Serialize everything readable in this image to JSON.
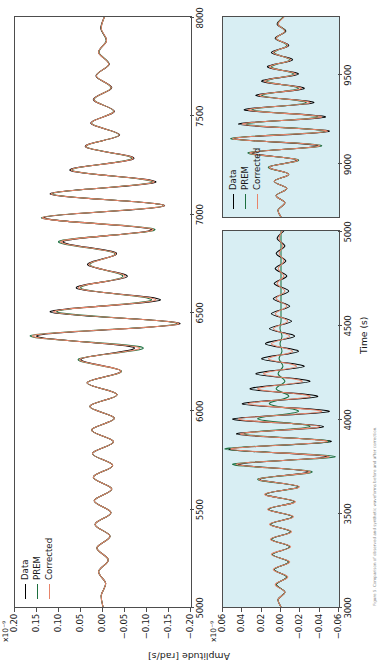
{
  "figure": {
    "shared_ylabel": "Amplitude [rad/s]",
    "shared_xlabel": "Time (s)",
    "background_plain": "#ffffff",
    "background_tinted": "#d8eef3",
    "caption": "Figure 5. Comparison of observed and synthetic waveforms before and after correction."
  },
  "legend": {
    "entries": [
      {
        "label": "Data",
        "color": "#000000"
      },
      {
        "label": "PREM",
        "color": "#1d6f3f"
      },
      {
        "label": "Corrected",
        "color": "#e8846a"
      }
    ]
  },
  "chart_data": [
    {
      "id": "panel-top",
      "type": "line",
      "title": "",
      "xlabel": "",
      "ylabel": "Amplitude [rad/s]",
      "y_exponent": "x10⁻⁹",
      "xlim": [
        5000,
        8000
      ],
      "ylim": [
        -0.2,
        0.2
      ],
      "xticks": [
        5000,
        5500,
        6000,
        6500,
        7000,
        7500,
        8000
      ],
      "xticklabels": [
        "5000",
        "5500",
        "6000",
        "6500",
        "7000",
        "7500",
        "8000"
      ],
      "yticks": [
        0.2,
        0.15,
        0.1,
        0.05,
        0.0,
        -0.05,
        -0.1,
        -0.15,
        -0.2
      ],
      "yticklabels": [
        "0.20",
        "0.15",
        "0.10",
        "0.05",
        "0.00",
        "−0.05",
        "−0.10",
        "−0.15",
        "−0.20"
      ],
      "grid": false,
      "legend_position": "top-left",
      "background": "#ffffff",
      "series": [
        {
          "name": "Data",
          "color": "#000000",
          "x": [
            5000,
            5060,
            5120,
            5180,
            5240,
            5300,
            5360,
            5420,
            5480,
            5540,
            5600,
            5660,
            5720,
            5780,
            5840,
            5900,
            5960,
            6020,
            6080,
            6140,
            6200,
            6260,
            6320,
            6380,
            6440,
            6500,
            6560,
            6620,
            6680,
            6740,
            6800,
            6860,
            6920,
            6980,
            7040,
            7100,
            7160,
            7220,
            7280,
            7340,
            7400,
            7460,
            7520,
            7580,
            7640,
            7700,
            7760,
            7820,
            7880,
            7940,
            8000
          ],
          "y": [
            0.0,
            0.004,
            -0.006,
            0.01,
            -0.012,
            0.014,
            -0.016,
            0.018,
            -0.018,
            0.02,
            -0.02,
            0.022,
            -0.022,
            0.024,
            -0.024,
            0.026,
            -0.026,
            0.03,
            -0.032,
            0.036,
            -0.04,
            0.05,
            -0.07,
            0.15,
            -0.175,
            0.12,
            -0.13,
            0.06,
            -0.055,
            0.035,
            -0.03,
            0.09,
            -0.11,
            0.135,
            -0.14,
            0.12,
            -0.12,
            0.075,
            -0.07,
            0.04,
            -0.038,
            0.028,
            -0.026,
            0.022,
            -0.02,
            0.016,
            -0.014,
            0.01,
            -0.008,
            0.005,
            -0.003
          ]
        },
        {
          "name": "PREM",
          "color": "#1d6f3f",
          "x": [
            5000,
            5060,
            5120,
            5180,
            5240,
            5300,
            5360,
            5420,
            5480,
            5540,
            5600,
            5660,
            5720,
            5780,
            5840,
            5900,
            5960,
            6020,
            6080,
            6140,
            6200,
            6260,
            6320,
            6380,
            6440,
            6500,
            6560,
            6620,
            6680,
            6740,
            6800,
            6860,
            6920,
            6980,
            7040,
            7100,
            7160,
            7220,
            7280,
            7340,
            7400,
            7460,
            7520,
            7580,
            7640,
            7700,
            7760,
            7820,
            7880,
            7940,
            8000
          ],
          "y": [
            0.0,
            0.004,
            -0.006,
            0.01,
            -0.012,
            0.014,
            -0.016,
            0.018,
            -0.018,
            0.02,
            -0.02,
            0.022,
            -0.022,
            0.024,
            -0.024,
            0.026,
            -0.026,
            0.03,
            -0.032,
            0.036,
            -0.042,
            0.056,
            -0.09,
            0.165,
            -0.168,
            0.105,
            -0.11,
            0.05,
            -0.045,
            0.03,
            -0.026,
            0.1,
            -0.118,
            0.14,
            -0.138,
            0.115,
            -0.112,
            0.07,
            -0.065,
            0.038,
            -0.036,
            0.026,
            -0.024,
            0.02,
            -0.018,
            0.015,
            -0.013,
            0.009,
            -0.007,
            0.004,
            -0.003
          ]
        },
        {
          "name": "Corrected",
          "color": "#e8846a",
          "x": [
            5000,
            5060,
            5120,
            5180,
            5240,
            5300,
            5360,
            5420,
            5480,
            5540,
            5600,
            5660,
            5720,
            5780,
            5840,
            5900,
            5960,
            6020,
            6080,
            6140,
            6200,
            6260,
            6320,
            6380,
            6440,
            6500,
            6560,
            6620,
            6680,
            6740,
            6800,
            6860,
            6920,
            6980,
            7040,
            7100,
            7160,
            7220,
            7280,
            7340,
            7400,
            7460,
            7520,
            7580,
            7640,
            7700,
            7760,
            7820,
            7880,
            7940,
            8000
          ],
          "y": [
            0.0,
            0.004,
            -0.006,
            0.01,
            -0.012,
            0.014,
            -0.016,
            0.018,
            -0.018,
            0.02,
            -0.02,
            0.022,
            -0.022,
            0.024,
            -0.024,
            0.026,
            -0.026,
            0.03,
            -0.032,
            0.036,
            -0.041,
            0.053,
            -0.082,
            0.16,
            -0.172,
            0.112,
            -0.12,
            0.055,
            -0.05,
            0.032,
            -0.028,
            0.095,
            -0.114,
            0.138,
            -0.139,
            0.118,
            -0.116,
            0.072,
            -0.068,
            0.039,
            -0.037,
            0.027,
            -0.025,
            0.021,
            -0.019,
            0.015,
            -0.013,
            0.01,
            -0.008,
            0.004,
            -0.003
          ]
        }
      ]
    },
    {
      "id": "panel-bottom-left",
      "type": "line",
      "title": "",
      "xlabel": "Time (s)",
      "ylabel": "Amplitude [rad/s]",
      "y_exponent": "x10⁻⁹",
      "xlim": [
        3000,
        5000
      ],
      "ylim": [
        -0.06,
        0.06
      ],
      "xticks": [
        3000,
        3500,
        4000,
        4500,
        5000
      ],
      "xticklabels": [
        "3000",
        "3500",
        "4000",
        "4500",
        "5000"
      ],
      "yticks": [
        0.06,
        0.04,
        0.02,
        0.0,
        -0.02,
        -0.04,
        -0.06
      ],
      "yticklabels": [
        "0.06",
        "0.04",
        "0.02",
        "0.00",
        "−0.02",
        "−0.04",
        "−0.06"
      ],
      "grid": false,
      "legend_position": "none",
      "background": "#d8eef3",
      "series": [
        {
          "name": "Data",
          "color": "#000000",
          "x": [
            3000,
            3040,
            3080,
            3120,
            3160,
            3200,
            3240,
            3280,
            3320,
            3360,
            3400,
            3440,
            3480,
            3520,
            3560,
            3600,
            3640,
            3680,
            3720,
            3760,
            3800,
            3840,
            3880,
            3920,
            3960,
            4000,
            4040,
            4080,
            4120,
            4160,
            4200,
            4240,
            4280,
            4320,
            4360,
            4400,
            4440,
            4480,
            4520,
            4560,
            4600,
            4640,
            4680,
            4720,
            4760,
            4800,
            4840,
            4880,
            4920,
            4960,
            5000
          ],
          "y": [
            0.0,
            0.003,
            -0.004,
            0.005,
            -0.006,
            0.007,
            -0.008,
            0.009,
            -0.009,
            0.01,
            -0.01,
            0.011,
            -0.012,
            0.013,
            -0.014,
            0.016,
            -0.018,
            0.022,
            -0.028,
            0.044,
            -0.048,
            0.054,
            -0.052,
            0.046,
            -0.044,
            0.05,
            -0.05,
            0.04,
            -0.038,
            0.032,
            -0.03,
            0.026,
            -0.024,
            0.02,
            -0.018,
            0.016,
            -0.014,
            0.012,
            -0.011,
            0.01,
            -0.009,
            0.008,
            -0.008,
            0.007,
            -0.006,
            0.006,
            -0.005,
            0.005,
            -0.004,
            0.004,
            -0.003
          ]
        },
        {
          "name": "PREM",
          "color": "#1d6f3f",
          "x": [
            3000,
            3040,
            3080,
            3120,
            3160,
            3200,
            3240,
            3280,
            3320,
            3360,
            3400,
            3440,
            3480,
            3520,
            3560,
            3600,
            3640,
            3680,
            3720,
            3760,
            3800,
            3840,
            3880,
            3920,
            3960,
            4000,
            4040,
            4080,
            4120,
            4160,
            4200,
            4240,
            4280,
            4320,
            4360,
            4400,
            4440,
            4480,
            4520,
            4560,
            4600,
            4640,
            4680,
            4720,
            4760,
            4800,
            4840,
            4880,
            4920,
            4960,
            5000
          ],
          "y": [
            0.0,
            0.003,
            -0.004,
            0.005,
            -0.006,
            0.007,
            -0.008,
            0.009,
            -0.009,
            0.01,
            -0.01,
            0.011,
            -0.012,
            0.013,
            -0.014,
            0.016,
            -0.018,
            0.024,
            -0.032,
            0.05,
            -0.056,
            0.058,
            -0.05,
            0.038,
            -0.03,
            0.024,
            -0.018,
            0.012,
            -0.008,
            0.005,
            -0.004,
            0.003,
            -0.002,
            0.002,
            -0.001,
            0.001,
            -0.001,
            0.001,
            0.0,
            0.0,
            0.0,
            0.0,
            0.0,
            0.0,
            0.0,
            0.0,
            0.0,
            0.0,
            0.0,
            0.0,
            0.0
          ]
        },
        {
          "name": "Corrected",
          "color": "#e8846a",
          "x": [
            3000,
            3040,
            3080,
            3120,
            3160,
            3200,
            3240,
            3280,
            3320,
            3360,
            3400,
            3440,
            3480,
            3520,
            3560,
            3600,
            3640,
            3680,
            3720,
            3760,
            3800,
            3840,
            3880,
            3920,
            3960,
            4000,
            4040,
            4080,
            4120,
            4160,
            4200,
            4240,
            4280,
            4320,
            4360,
            4400,
            4440,
            4480,
            4520,
            4560,
            4600,
            4640,
            4680,
            4720,
            4760,
            4800,
            4840,
            4880,
            4920,
            4960,
            5000
          ],
          "y": [
            0.0,
            0.003,
            -0.004,
            0.006,
            -0.007,
            0.008,
            -0.009,
            0.01,
            -0.01,
            0.011,
            -0.011,
            0.012,
            -0.013,
            0.014,
            -0.015,
            0.017,
            -0.019,
            0.023,
            -0.03,
            0.046,
            -0.05,
            0.052,
            -0.048,
            0.042,
            -0.04,
            0.044,
            -0.042,
            0.034,
            -0.03,
            0.024,
            -0.022,
            0.018,
            -0.016,
            0.013,
            -0.012,
            0.01,
            -0.009,
            0.008,
            -0.007,
            0.006,
            -0.006,
            0.005,
            -0.004,
            0.004,
            -0.003,
            0.003,
            -0.003,
            0.002,
            -0.002,
            0.002,
            -0.001
          ]
        }
      ]
    },
    {
      "id": "panel-bottom-right",
      "type": "line",
      "title": "",
      "xlabel": "Time (s)",
      "ylabel": "",
      "y_exponent": "",
      "xlim": [
        8700,
        9820
      ],
      "ylim": [
        -0.06,
        0.06
      ],
      "xticks": [
        9000,
        9500
      ],
      "xticklabels": [
        "9000",
        "9500"
      ],
      "yticks": [],
      "yticklabels": [],
      "grid": false,
      "legend_position": "top-left",
      "background": "#d8eef3",
      "series": [
        {
          "name": "Data",
          "color": "#000000",
          "x": [
            8700,
            8740,
            8780,
            8820,
            8860,
            8900,
            8940,
            8980,
            9020,
            9060,
            9100,
            9140,
            9180,
            9220,
            9260,
            9300,
            9340,
            9380,
            9420,
            9460,
            9500,
            9540,
            9580,
            9620,
            9660,
            9700,
            9740,
            9780,
            9820
          ],
          "y": [
            0.0,
            0.003,
            -0.004,
            0.005,
            -0.006,
            0.007,
            -0.008,
            0.012,
            -0.016,
            0.03,
            -0.038,
            0.048,
            -0.05,
            0.044,
            -0.046,
            0.038,
            -0.034,
            0.026,
            -0.024,
            0.02,
            -0.018,
            0.014,
            -0.012,
            0.01,
            -0.008,
            0.006,
            -0.005,
            0.004,
            -0.003
          ]
        },
        {
          "name": "PREM",
          "color": "#1d6f3f",
          "x": [
            8700,
            8740,
            8780,
            8820,
            8860,
            8900,
            8940,
            8980,
            9020,
            9060,
            9100,
            9140,
            9180,
            9220,
            9260,
            9300,
            9340,
            9380,
            9420,
            9460,
            9500,
            9540,
            9580,
            9620,
            9660,
            9700,
            9740,
            9780,
            9820
          ],
          "y": [
            0.0,
            0.003,
            -0.004,
            0.005,
            -0.006,
            0.007,
            -0.008,
            0.013,
            -0.018,
            0.034,
            -0.042,
            0.052,
            -0.046,
            0.036,
            -0.038,
            0.03,
            -0.026,
            0.02,
            -0.018,
            0.015,
            -0.013,
            0.01,
            -0.009,
            0.007,
            -0.006,
            0.005,
            -0.004,
            0.003,
            -0.002
          ]
        },
        {
          "name": "Corrected",
          "color": "#e8846a",
          "x": [
            8700,
            8740,
            8780,
            8820,
            8860,
            8900,
            8940,
            8980,
            9020,
            9060,
            9100,
            9140,
            9180,
            9220,
            9260,
            9300,
            9340,
            9380,
            9420,
            9460,
            9500,
            9540,
            9580,
            9620,
            9660,
            9700,
            9740,
            9780,
            9820
          ],
          "y": [
            0.0,
            0.003,
            -0.004,
            0.005,
            -0.006,
            0.007,
            -0.008,
            0.012,
            -0.017,
            0.032,
            -0.04,
            0.05,
            -0.048,
            0.04,
            -0.042,
            0.034,
            -0.03,
            0.023,
            -0.021,
            0.017,
            -0.015,
            0.012,
            -0.01,
            0.008,
            -0.007,
            0.005,
            -0.004,
            0.003,
            -0.003
          ]
        }
      ]
    }
  ]
}
